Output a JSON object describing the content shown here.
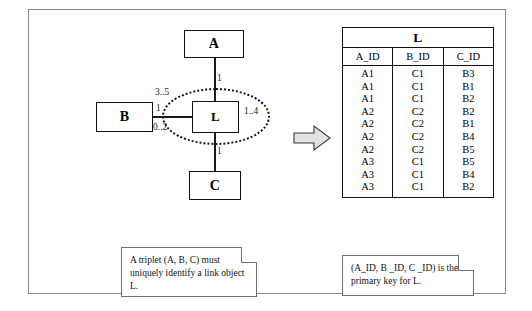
{
  "diagram": {
    "classes": [
      {
        "name": "A"
      },
      {
        "name": "B"
      },
      {
        "name": "C"
      },
      {
        "name": "L"
      }
    ],
    "multiplicities": {
      "a_end": "1",
      "b_end": "1",
      "c_end": "1",
      "l_upper_left": "3..5",
      "l_right": "1..4",
      "l_lower_left": "0..2"
    },
    "arrow": "right-block-arrow"
  },
  "table": {
    "title": "L",
    "columns": [
      "A_ID",
      "B_ID",
      "C_ID"
    ],
    "rows": [
      [
        "A1",
        "C1",
        "B3"
      ],
      [
        "A1",
        "C1",
        "B1"
      ],
      [
        "A1",
        "C1",
        "B2"
      ],
      [
        "A2",
        "C2",
        "B2"
      ],
      [
        "A2",
        "C2",
        "B1"
      ],
      [
        "A2",
        "C2",
        "B4"
      ],
      [
        "A2",
        "C2",
        "B5"
      ],
      [
        "A3",
        "C1",
        "B5"
      ],
      [
        "A3",
        "C1",
        "B4"
      ],
      [
        "A3",
        "C1",
        "B2"
      ]
    ]
  },
  "notes": {
    "left": "A triplet (A, B, C) must uniquely identify a link object L.",
    "right": "(A_ID, B _ID, C _ID) is the primary key for L."
  }
}
